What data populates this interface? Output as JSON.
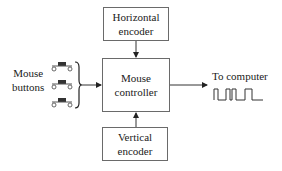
{
  "diagram": {
    "type": "block-diagram",
    "nodes": [
      {
        "id": "horizontal_encoder",
        "label_line1": "Horizontal",
        "label_line2": "encoder"
      },
      {
        "id": "mouse_controller",
        "label_line1": "Mouse",
        "label_line2": "controller"
      },
      {
        "id": "vertical_encoder",
        "label_line1": "Vertical",
        "label_line2": "encoder"
      }
    ],
    "inputs": {
      "mouse_buttons": {
        "label_line1": "Mouse",
        "label_line2": "buttons",
        "count": 3
      }
    },
    "output": {
      "label": "To computer",
      "signal": "digital pulse waveform"
    },
    "edges": [
      {
        "from": "horizontal_encoder",
        "to": "mouse_controller"
      },
      {
        "from": "vertical_encoder",
        "to": "mouse_controller"
      },
      {
        "from": "mouse_buttons",
        "to": "mouse_controller"
      },
      {
        "from": "mouse_controller",
        "to": "To computer"
      }
    ]
  }
}
